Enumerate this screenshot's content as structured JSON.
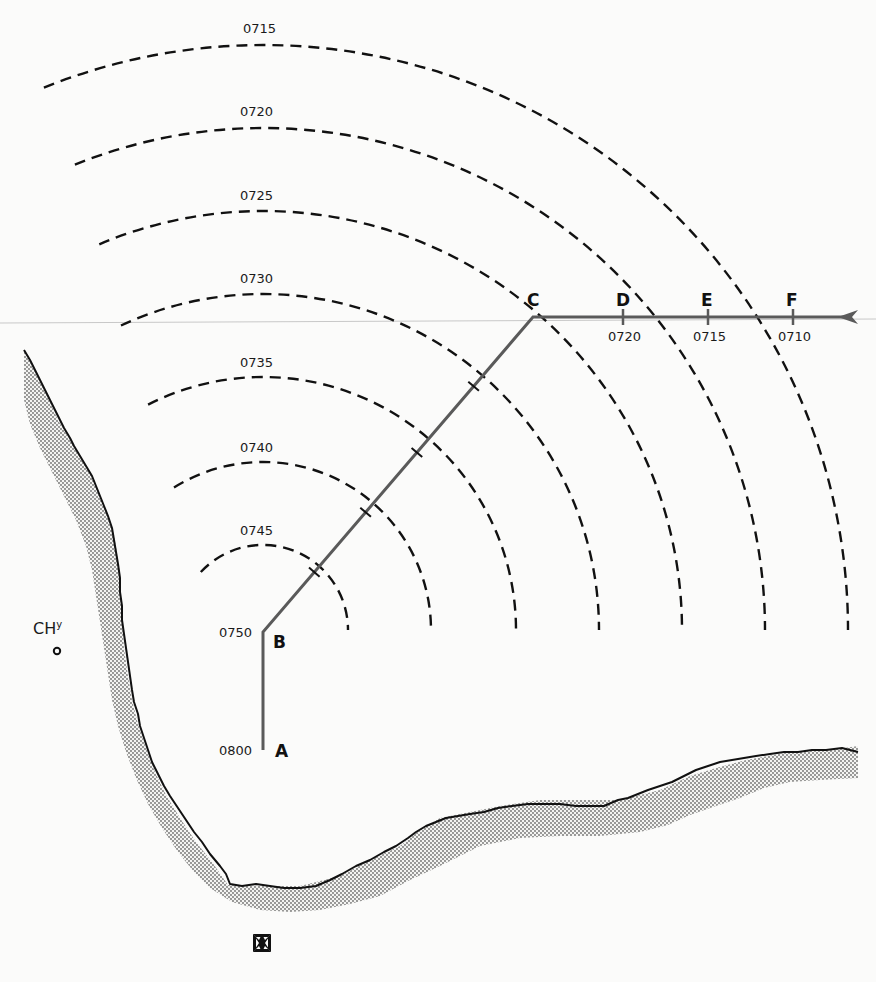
{
  "diagram": {
    "type": "navigation-plot",
    "center": {
      "x": 263,
      "y": 630
    },
    "range_arcs": [
      {
        "time": "0715",
        "r": 585,
        "start_deg": 112,
        "label_x": 243,
        "label_y": 33
      },
      {
        "time": "0720",
        "r": 502,
        "start_deg": 112,
        "label_x": 240,
        "label_y": 116
      },
      {
        "time": "0725",
        "r": 419,
        "start_deg": 113,
        "label_x": 240,
        "label_y": 200
      },
      {
        "time": "0730",
        "r": 336,
        "start_deg": 115,
        "label_x": 240,
        "label_y": 283
      },
      {
        "time": "0735",
        "r": 253,
        "start_deg": 117,
        "label_x": 240,
        "label_y": 367
      },
      {
        "time": "0740",
        "r": 168,
        "start_deg": 122,
        "label_x": 240,
        "label_y": 452
      },
      {
        "time": "0745",
        "r": 85,
        "start_deg": 137,
        "label_x": 240,
        "label_y": 535
      }
    ],
    "track_points": [
      {
        "id": "A",
        "time": "0800",
        "x": 263,
        "y": 750
      },
      {
        "id": "B",
        "time": "0750",
        "x": 263,
        "y": 632
      },
      {
        "id": "C",
        "time": "",
        "x": 533,
        "y": 317
      }
    ],
    "inbound_ticks": [
      {
        "id": "D",
        "time": "0720",
        "x": 623
      },
      {
        "id": "E",
        "time": "0715",
        "x": 708
      },
      {
        "id": "F",
        "time": "0710",
        "x": 793
      }
    ],
    "track_end_x": 858,
    "track_y": 317,
    "landmark": {
      "label": "CHy",
      "label_main": "CH",
      "label_sup": "y"
    },
    "colors": {
      "track": "#5a5a5a",
      "arc": "#111111",
      "coast": "#111111",
      "shade": "#9a9a9a"
    }
  }
}
